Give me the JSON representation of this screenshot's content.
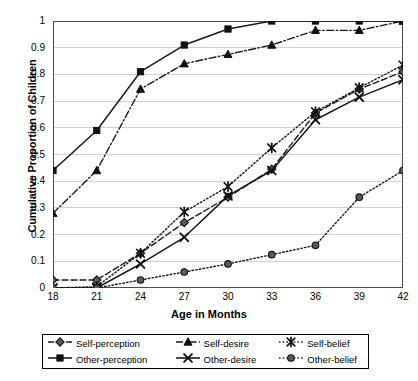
{
  "chart_data": {
    "type": "line",
    "title": "",
    "xlabel": "Age in Months",
    "ylabel": "Cumulative Proportion of Children",
    "x": [
      18,
      21,
      24,
      27,
      30,
      33,
      36,
      39,
      42
    ],
    "categories": [
      "18",
      "21",
      "24",
      "27",
      "30",
      "33",
      "36",
      "39",
      "42"
    ],
    "xlim": [
      18,
      42
    ],
    "ylim": [
      0,
      1
    ],
    "xticks": [
      "18",
      "21",
      "24",
      "27",
      "30",
      "33",
      "36",
      "39",
      "42"
    ],
    "yticks": [
      "0",
      "0.1",
      "0.2",
      "0.3",
      "0.4",
      "0.5",
      "0.6",
      "0.7",
      "0.8",
      "0.9",
      "1"
    ],
    "grid": "horizontal",
    "legend_position": "below-plot",
    "series": [
      {
        "name": "Self-perception",
        "marker": "diamond",
        "line": "dashed",
        "values": [
          0.03,
          0.03,
          0.13,
          0.245,
          0.34,
          0.445,
          0.655,
          0.745,
          0.81
        ]
      },
      {
        "name": "Other-perception",
        "marker": "square",
        "line": "solid",
        "values": [
          0.44,
          0.59,
          0.81,
          0.91,
          0.97,
          1.0,
          1.0,
          1.0,
          1.0
        ]
      },
      {
        "name": "Self-desire",
        "marker": "triangle",
        "line": "dash-dot",
        "values": [
          0.28,
          0.44,
          0.745,
          0.84,
          0.875,
          0.91,
          0.965,
          0.965,
          1.0
        ]
      },
      {
        "name": "Other-desire",
        "marker": "x",
        "line": "solid",
        "values": [
          0.0,
          0.0,
          0.09,
          0.19,
          0.345,
          0.44,
          0.63,
          0.715,
          0.78
        ]
      },
      {
        "name": "Self-belief",
        "marker": "asterisk",
        "line": "dotted",
        "values": [
          0.0,
          0.005,
          0.13,
          0.285,
          0.38,
          0.525,
          0.66,
          0.75,
          0.835
        ]
      },
      {
        "name": "Other-belief",
        "marker": "circle",
        "line": "dotted",
        "values": [
          0.0,
          0.0,
          0.03,
          0.06,
          0.09,
          0.125,
          0.16,
          0.34,
          0.44
        ]
      }
    ]
  },
  "colors": {
    "axis": "#4a4a4a",
    "grid": "#cfcfcf",
    "line": "#1a1a1a",
    "marker_fill": "#5a5a5a",
    "background": "#ffffff"
  }
}
